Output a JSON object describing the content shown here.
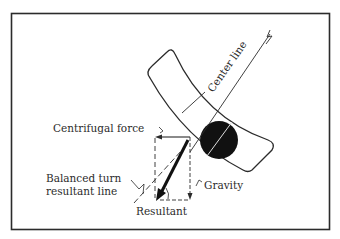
{
  "figure": {
    "labels": {
      "center_line": "Center line",
      "centrifugal_force": "Centrifugal force",
      "balanced_turn_line1": "Balanced turn",
      "balanced_turn_line2": "resultant line",
      "gravity": "Gravity",
      "resultant": "Resultant"
    },
    "elements": [
      {
        "name": "banked-track",
        "shape": "curved band"
      },
      {
        "name": "ball",
        "shape": "filled circle"
      },
      {
        "name": "center-line",
        "shape": "diagonal line"
      },
      {
        "name": "centrifugal-force-arrow",
        "direction": "left"
      },
      {
        "name": "gravity-arrow",
        "direction": "down"
      },
      {
        "name": "resultant-arrow",
        "direction": "down-left",
        "style": "bold"
      },
      {
        "name": "balanced-turn-resultant-line",
        "style": "dashed diagonal"
      }
    ],
    "colors": {
      "ink": "#2b2b2b",
      "background": "#ffffff"
    }
  }
}
